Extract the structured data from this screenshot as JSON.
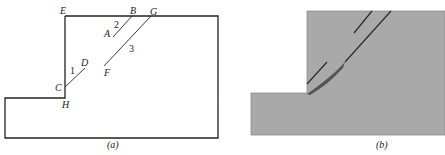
{
  "panel_a": {
    "caption": "(a)",
    "points": {
      "E": "E",
      "B": "B",
      "G": "G",
      "A": "A",
      "D": "D",
      "F": "F",
      "C": "C",
      "H": "H"
    },
    "cracks": {
      "crack1": "1",
      "crack2": "2",
      "crack3": "3"
    }
  },
  "panel_b": {
    "caption": "(b)",
    "colors": {
      "fill": "#a9a9a9",
      "crack": "#2b2b2b",
      "failure_zone": "#555555"
    }
  }
}
